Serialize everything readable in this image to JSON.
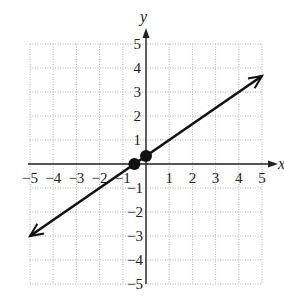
{
  "chart_data": {
    "type": "line",
    "title": "",
    "xlabel": "x",
    "ylabel": "y",
    "xlim": [
      -5,
      5
    ],
    "ylim": [
      -5,
      5
    ],
    "grid": true,
    "grid_style": "dotted",
    "x_ticks": [
      "-5",
      "-4",
      "-3",
      "-2",
      "-1",
      "1",
      "2",
      "3",
      "4",
      "5"
    ],
    "y_ticks": [
      "5",
      "4",
      "3",
      "2",
      "1",
      "-1",
      "-2",
      "-3",
      "-4",
      "-5"
    ],
    "series": [
      {
        "name": "line",
        "equation": "y = (2/3)x + 1/3",
        "x": [
          -5,
          5
        ],
        "y": [
          -3,
          3.667
        ],
        "arrows": "both"
      }
    ],
    "points": [
      {
        "x": -0.5,
        "y": 0
      },
      {
        "x": 0,
        "y": 0.333
      }
    ]
  },
  "labels": {
    "x_axis": "x",
    "y_axis": "y",
    "x_ticks": [
      "−5",
      "−4",
      "−3",
      "−2",
      "−1",
      "1",
      "2",
      "3",
      "4",
      "5"
    ],
    "y_ticks_pos": [
      "1",
      "2",
      "3",
      "4",
      "5"
    ],
    "y_ticks_neg": [
      "−1",
      "−2",
      "−3",
      "−4",
      "−5"
    ]
  },
  "colors": {
    "line": "#111111",
    "grid": "#b0b0b0",
    "axis": "#222222",
    "point": "#111111"
  }
}
